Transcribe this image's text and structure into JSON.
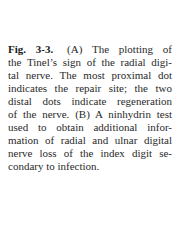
{
  "caption": {
    "label": "Fig. 3-3.",
    "lines": [
      "(A) The plotting of",
      "the Tinel’s sign of the radial digi-",
      "tal nerve. The most proximal dot",
      "indicates the repair site; the two",
      "distal dots indicate regeneration",
      "of the nerve. (B) A ninhydrin test",
      "used to obtain additional infor-",
      "mation of radial and ulnar digital",
      "nerve loss of the index digit se-",
      "condary to infection."
    ]
  }
}
